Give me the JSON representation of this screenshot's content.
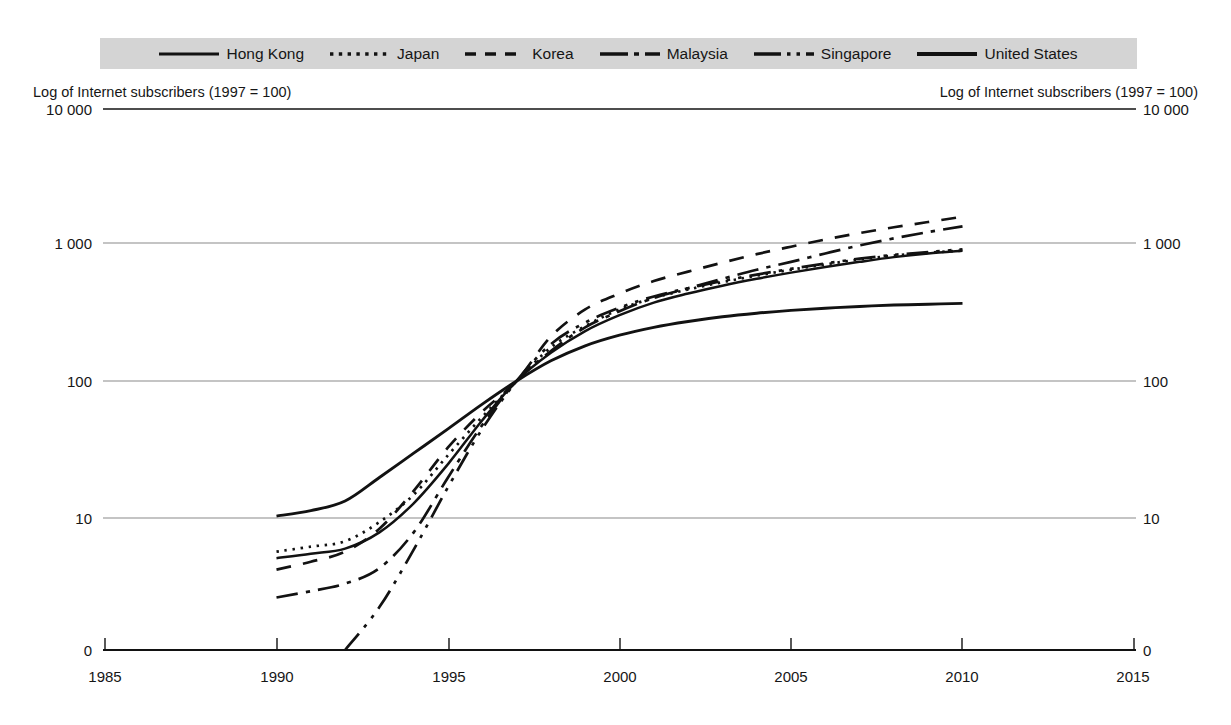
{
  "legend": {
    "position": "top",
    "background_color": "#d4d4d4",
    "entries": [
      {
        "label": "Hong Kong",
        "style": "solid",
        "icon": "line-swatch-solid-icon"
      },
      {
        "label": "Japan",
        "style": "dotted",
        "icon": "line-swatch-dotted-icon"
      },
      {
        "label": "Korea",
        "style": "dashed",
        "icon": "line-swatch-dashed-icon"
      },
      {
        "label": "Malaysia",
        "style": "dash-dot",
        "icon": "line-swatch-dash-dot-icon"
      },
      {
        "label": "Singapore",
        "style": "dash-dot-dot",
        "icon": "line-swatch-dash-dot-dot-icon"
      },
      {
        "label": "United States",
        "style": "solid-thick",
        "icon": "line-swatch-solid-thick-icon"
      }
    ]
  },
  "axis_titles": {
    "left": "Log of Internet subscribers (1997 = 100)",
    "right": "Log of Internet subscribers (1997 = 100)"
  },
  "ticks": {
    "y_labels": [
      "10 000",
      "1 000",
      "100",
      "10",
      "0"
    ],
    "x_labels": [
      "1985",
      "1990",
      "1995",
      "2000",
      "2005",
      "2010",
      "2015"
    ]
  },
  "colors": {
    "line": "#121212",
    "gridline": "#808080",
    "axis": "#121212",
    "legend_background": "#d4d4d4",
    "text": "#161616"
  },
  "chart_data": {
    "type": "line",
    "title": "",
    "subtitle": "",
    "xlabel": "",
    "ylabel": "Log of Internet subscribers (1997 = 100)",
    "y_scale": "log",
    "y_tick_values": [
      10000,
      1000,
      100,
      10,
      0
    ],
    "ylim": [
      1,
      10000
    ],
    "xlim": [
      1985,
      2015
    ],
    "x_tick_values": [
      1985,
      1990,
      1995,
      2000,
      2005,
      2010,
      2015
    ],
    "grid": true,
    "legend_position": "top",
    "index_base": {
      "year": 1997,
      "value": 100
    },
    "series": [
      {
        "name": "Hong Kong",
        "style": "solid",
        "x": [
          1990,
          1991,
          1992,
          1993,
          1994,
          1995,
          1996,
          1997,
          1998,
          1999,
          2000,
          2001,
          2002,
          2003,
          2004,
          2005,
          2006,
          2007,
          2008,
          2009,
          2010
        ],
        "values": [
          5.2,
          5.6,
          6.1,
          8.0,
          13.0,
          25.0,
          52.0,
          100,
          160,
          230,
          300,
          370,
          430,
          490,
          550,
          610,
          670,
          730,
          790,
          840,
          880
        ]
      },
      {
        "name": "Japan",
        "style": "dotted",
        "x": [
          1990,
          1991,
          1992,
          1993,
          1994,
          1995,
          1996,
          1997,
          1998,
          1999,
          2000,
          2001,
          2002,
          2003,
          2004,
          2005,
          2006,
          2007,
          2008,
          2009,
          2010
        ],
        "values": [
          5.8,
          6.3,
          6.9,
          9.5,
          15.0,
          29.0,
          55.0,
          100,
          175,
          250,
          330,
          400,
          460,
          520,
          580,
          640,
          700,
          760,
          810,
          850,
          880
        ]
      },
      {
        "name": "Korea",
        "style": "dashed",
        "x": [
          1990,
          1991,
          1992,
          1993,
          1994,
          1995,
          1996,
          1997,
          1998,
          1999,
          2000,
          2001,
          2002,
          2003,
          2004,
          2005,
          2006,
          2007,
          2008,
          2009,
          2010
        ],
        "values": [
          4.3,
          4.9,
          5.8,
          8.5,
          16.0,
          33.0,
          60.0,
          100,
          210,
          330,
          430,
          530,
          620,
          720,
          830,
          940,
          1060,
          1180,
          1300,
          1420,
          1550
        ]
      },
      {
        "name": "Malaysia",
        "style": "dash-dot",
        "x": [
          1990,
          1991,
          1992,
          1993,
          1994,
          1995,
          1996,
          1997,
          1998,
          1999,
          2000,
          2001,
          2002,
          2003,
          2004,
          2005,
          2006,
          2007,
          2008,
          2009,
          2010
        ],
        "values": [
          2.7,
          3.0,
          3.4,
          4.4,
          8.0,
          20.0,
          48.0,
          100,
          165,
          245,
          320,
          400,
          470,
          550,
          640,
          730,
          840,
          960,
          1080,
          1200,
          1320
        ]
      },
      {
        "name": "Singapore",
        "style": "dash-dot-dot",
        "x": [
          1992,
          1993,
          1994,
          1995,
          1996,
          1997,
          1998,
          1999,
          2000,
          2001,
          2002,
          2003,
          2004,
          2005,
          2006,
          2007,
          2008,
          2009,
          2010
        ],
        "values": [
          1.0,
          2.3,
          6.0,
          17.0,
          45.0,
          100,
          185,
          265,
          340,
          410,
          470,
          530,
          590,
          650,
          710,
          770,
          820,
          860,
          900
        ]
      },
      {
        "name": "United States",
        "style": "solid-thick",
        "x": [
          1990,
          1991,
          1992,
          1993,
          1994,
          1995,
          1996,
          1997,
          1998,
          1999,
          2000,
          2001,
          2002,
          2003,
          2004,
          2005,
          2006,
          2007,
          2008,
          2009,
          2010
        ],
        "values": [
          10.5,
          11.5,
          13.5,
          20.0,
          30.0,
          45.0,
          68.0,
          100,
          140,
          180,
          215,
          245,
          270,
          292,
          310,
          325,
          337,
          347,
          355,
          360,
          365
        ]
      }
    ]
  }
}
